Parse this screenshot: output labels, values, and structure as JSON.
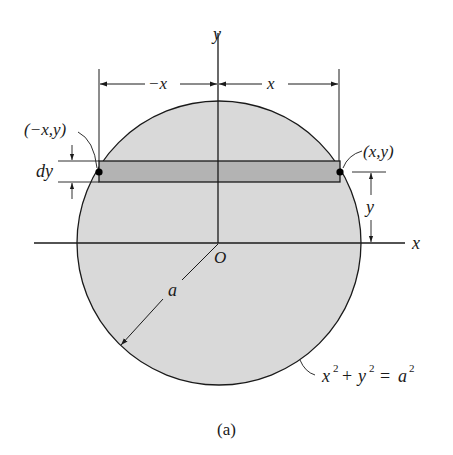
{
  "figure": {
    "caption": "(a)",
    "colors": {
      "background": "#ffffff",
      "circle_fill": "#d9d9d9",
      "strip_fill": "#b3b3b3",
      "stroke": "#1a1a1a"
    },
    "labels": {
      "y_axis": "y",
      "x_axis": "x",
      "origin": "O",
      "radius": "a",
      "dim_left": "−x",
      "dim_right": "x",
      "left_point": "(−x,y)",
      "right_point": "(x,y)",
      "strip_height": "dy",
      "strip_elevation": "y",
      "equation_x": "x",
      "equation_plus": "+",
      "equation_y": "y",
      "equation_eq": "=",
      "equation_a": "a",
      "equation_exp": "2"
    }
  }
}
